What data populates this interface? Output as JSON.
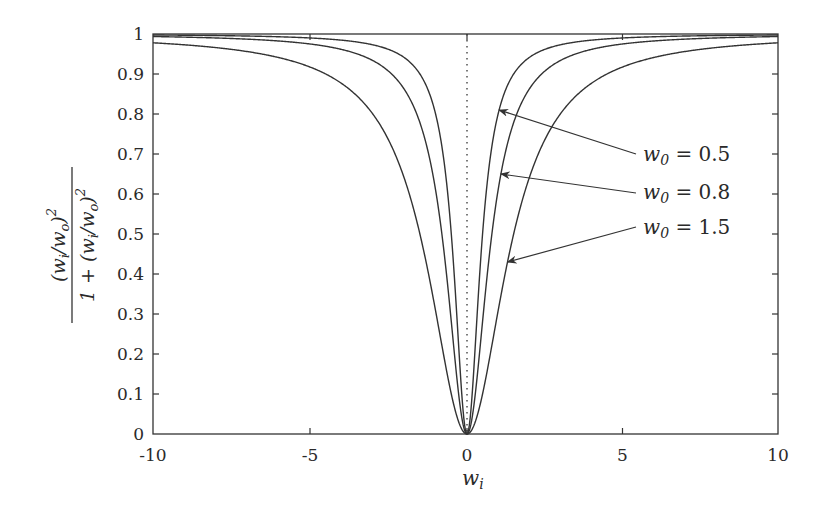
{
  "chart_data": {
    "type": "line",
    "title": "",
    "xlabel": "w_i",
    "ylabel": "(w_i/w_o)^2 / (1 + (w_i/w_o)^2)",
    "ylabel_parts": {
      "numerator": "(w_i/w_o)^2",
      "denominator": "1 + (w_i/w_o)^2"
    },
    "xlim": [
      -10,
      10
    ],
    "ylim": [
      0,
      1
    ],
    "xticks": [
      -10,
      -5,
      0,
      5,
      10
    ],
    "xtick_labels": [
      "-10",
      "-5",
      "0",
      "5",
      "10"
    ],
    "yticks": [
      0,
      0.1,
      0.2,
      0.3,
      0.4,
      0.5,
      0.6,
      0.7,
      0.8,
      0.9,
      1
    ],
    "ytick_labels": [
      "0",
      "0.1",
      "0.2",
      "0.3",
      "0.4",
      "0.5",
      "0.6",
      "0.7",
      "0.8",
      "0.9",
      "1"
    ],
    "grid": false,
    "legend": "annotations with arrows (right side)",
    "reference_line": {
      "type": "vertical dotted",
      "x": 0
    },
    "function": "y = (x/w0)^2 / (1 + (x/w0)^2)",
    "x": [
      -10,
      -8,
      -6,
      -4,
      -3,
      -2,
      -1.5,
      -1,
      -0.5,
      0,
      0.5,
      1,
      1.5,
      2,
      3,
      4,
      6,
      8,
      10
    ],
    "series": [
      {
        "name": "w0 = 0.5",
        "w0": 0.5,
        "values": [
          0.9975,
          0.9961,
          0.9931,
          0.9846,
          0.973,
          0.9412,
          0.9,
          0.8,
          0.5,
          0,
          0.5,
          0.8,
          0.9,
          0.9412,
          0.973,
          0.9846,
          0.9931,
          0.9961,
          0.9975
        ]
      },
      {
        "name": "w0 = 0.8",
        "w0": 0.8,
        "values": [
          0.9936,
          0.9901,
          0.9825,
          0.9615,
          0.9336,
          0.8621,
          0.7785,
          0.6098,
          0.2809,
          0,
          0.2809,
          0.6098,
          0.7785,
          0.8621,
          0.9336,
          0.9615,
          0.9825,
          0.9901,
          0.9936
        ]
      },
      {
        "name": "w0 = 1.5",
        "w0": 1.5,
        "values": [
          0.978,
          0.966,
          0.9412,
          0.8767,
          0.8,
          0.64,
          0.5,
          0.3077,
          0.1,
          0,
          0.1,
          0.3077,
          0.5,
          0.64,
          0.8,
          0.8767,
          0.9412,
          0.966,
          0.978
        ]
      }
    ],
    "annotations": [
      {
        "text": "w0 = 0.5",
        "points_to_series": "w0 = 0.5"
      },
      {
        "text": "w0 = 0.8",
        "points_to_series": "w0 = 0.8"
      },
      {
        "text": "w0 = 1.5",
        "points_to_series": "w0 = 1.5"
      }
    ],
    "colors": {
      "line": "#333333",
      "axis": "#333333",
      "background": "#ffffff"
    }
  },
  "labels": {
    "xlabel_base": "w",
    "xlabel_sub": "i",
    "annotations": [
      {
        "base": "w",
        "sub": "0",
        "rest": " = 0.5"
      },
      {
        "base": "w",
        "sub": "0",
        "rest": " = 0.8"
      },
      {
        "base": "w",
        "sub": "0",
        "rest": " = 1.5"
      }
    ]
  }
}
